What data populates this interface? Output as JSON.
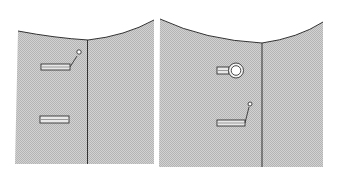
{
  "figure": {
    "panels": [
      {
        "id": "left",
        "description": "Wall panel with a divider line; upper slot with a switch lever, lower plain slot",
        "elements": [
          "slot-with-lever",
          "plain-slot"
        ]
      },
      {
        "id": "right",
        "description": "Wall panel with a divider line; upper slot with round knob, lower slot with lever",
        "elements": [
          "slot-with-knob",
          "slot-with-lever"
        ]
      }
    ],
    "colors": {
      "background": "#ffffff",
      "panel_fill": "#c9c9c9",
      "line": "#333333"
    }
  }
}
